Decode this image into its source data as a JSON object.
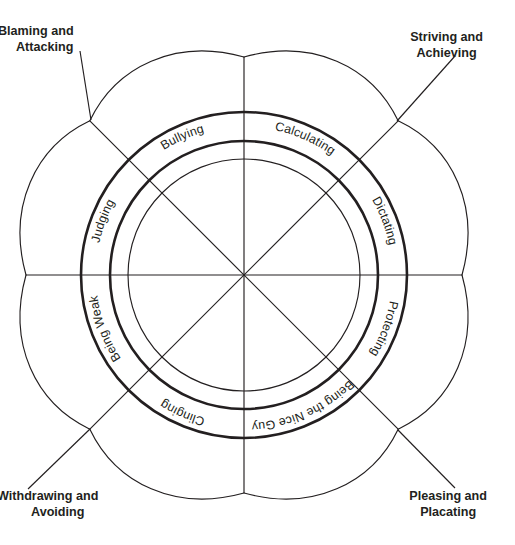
{
  "diagram": {
    "center": {
      "x": 244,
      "y": 275
    },
    "radii": {
      "inner_thin_circle": 116,
      "inner_thick_circle": 134,
      "outer_thick_circle": 163,
      "petal_cusp": 218
    },
    "colors": {
      "stroke": "#231f20",
      "background": "#ffffff"
    },
    "ring_labels": [
      {
        "id": "bullying",
        "text": "Bullying",
        "sector_center_deg": 292.5,
        "reading": "clockwise-along-arc"
      },
      {
        "id": "calculating",
        "text": "Calculating",
        "sector_center_deg": 337.5,
        "reading": "clockwise-along-arc"
      },
      {
        "id": "dictating",
        "text": "Dictating",
        "sector_center_deg": 22.5,
        "reading": "clockwise-along-arc"
      },
      {
        "id": "protecting",
        "text": "Protecting",
        "sector_center_deg": 67.5,
        "reading": "clockwise-along-arc"
      },
      {
        "id": "being-the-nice-guy",
        "text": "Being the Nice Guy",
        "sector_center_deg": 112.5,
        "reading": "counter-clockwise-along-arc"
      },
      {
        "id": "clinging",
        "text": "Clinging",
        "sector_center_deg": 157.5,
        "reading": "counter-clockwise-along-arc"
      },
      {
        "id": "being-weak",
        "text": "Being Weak",
        "sector_center_deg": 202.5,
        "reading": "counter-clockwise-along-arc"
      },
      {
        "id": "judging",
        "text": "Judging",
        "sector_center_deg": 247.5,
        "reading": "counter-clockwise-along-arc"
      }
    ],
    "corner_labels": [
      {
        "id": "blaming-attacking",
        "line1": "Blaming and",
        "line2": "Attacking",
        "corner": "top-left",
        "leader": {
          "x1": 82,
          "y1": 52,
          "x2": 90,
          "y2": 121
        }
      },
      {
        "id": "striving-achieving",
        "line1": "Striving and",
        "line2": "Achieving",
        "corner": "top-right",
        "leader": {
          "x1": 452,
          "y1": 57,
          "x2": 398,
          "y2": 121
        }
      },
      {
        "id": "withdrawing-avoiding",
        "line1": "Withdrawing and",
        "line2": "Avoiding",
        "corner": "bottom-left",
        "leader": {
          "x1": 32,
          "y1": 488,
          "x2": 90,
          "y2": 429
        }
      },
      {
        "id": "pleasing-placating",
        "line1": "Pleasing and",
        "line2": "Placating",
        "corner": "bottom-right",
        "leader": {
          "x1": 452,
          "y1": 487,
          "x2": 398,
          "y2": 429
        }
      }
    ]
  }
}
